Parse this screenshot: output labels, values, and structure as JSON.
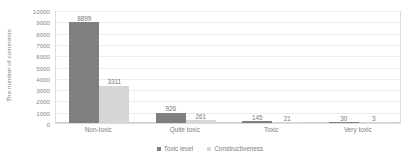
{
  "chart_data": {
    "type": "bar",
    "title": "",
    "xlabel": "",
    "ylabel": "The number of comments",
    "ylim": [
      0,
      10000
    ],
    "ytick_step": 1000,
    "yticks": [
      "10000",
      "9000",
      "8000",
      "7000",
      "6000",
      "5000",
      "4000",
      "3000",
      "2000",
      "1000",
      "0"
    ],
    "grid": true,
    "legend_position": "bottom-center",
    "categories": [
      "Non-toxic",
      "Quite toxic",
      "Toxic",
      "Very toxic"
    ],
    "series": [
      {
        "name": "Toxic level",
        "color": "#7f7f7f",
        "values": [
          8899,
          926,
          145,
          30
        ],
        "labels": [
          "8899",
          "926",
          "145",
          "30"
        ]
      },
      {
        "name": "Constructiveness",
        "color": "#d6d6d6",
        "values": [
          3311,
          261,
          21,
          3
        ],
        "labels": [
          "3311",
          "261",
          "21",
          "3"
        ]
      }
    ]
  },
  "legend": {
    "items": [
      {
        "label": "Toxic level",
        "color": "#7f7f7f"
      },
      {
        "label": "Constructiveness",
        "color": "#d6d6d6"
      }
    ]
  }
}
